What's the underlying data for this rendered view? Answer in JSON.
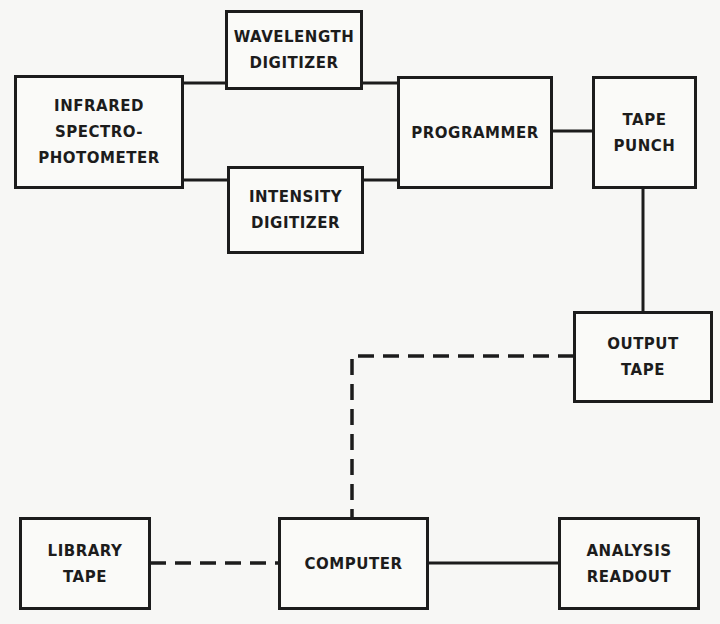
{
  "colors": {
    "ink": "#1c1c1c",
    "paper": "#f7f7f5"
  },
  "nodes": {
    "infrared": {
      "lines": [
        "INFRARED",
        "SPECTRO-",
        "PHOTOMETER"
      ]
    },
    "wavelength": {
      "lines": [
        "WAVELENGTH",
        "DIGITIZER"
      ]
    },
    "intensity": {
      "lines": [
        "INTENSITY",
        "DIGITIZER"
      ]
    },
    "programmer": {
      "lines": [
        "PROGRAMMER"
      ]
    },
    "tape_punch": {
      "lines": [
        "TAPE",
        "PUNCH"
      ]
    },
    "output_tape": {
      "lines": [
        "OUTPUT",
        "TAPE"
      ]
    },
    "library_tape": {
      "lines": [
        "LIBRARY",
        "TAPE"
      ]
    },
    "computer": {
      "lines": [
        "COMPUTER"
      ]
    },
    "analysis_readout": {
      "lines": [
        "ANALYSIS",
        "READOUT"
      ]
    }
  },
  "edges": [
    {
      "from": "infrared",
      "to": "wavelength",
      "style": "solid"
    },
    {
      "from": "infrared",
      "to": "intensity",
      "style": "solid"
    },
    {
      "from": "wavelength",
      "to": "programmer",
      "style": "solid"
    },
    {
      "from": "intensity",
      "to": "programmer",
      "style": "solid"
    },
    {
      "from": "programmer",
      "to": "tape_punch",
      "style": "solid"
    },
    {
      "from": "tape_punch",
      "to": "output_tape",
      "style": "solid"
    },
    {
      "from": "output_tape",
      "to": "computer",
      "style": "dashed"
    },
    {
      "from": "library_tape",
      "to": "computer",
      "style": "dashed"
    },
    {
      "from": "computer",
      "to": "analysis_readout",
      "style": "solid"
    }
  ]
}
